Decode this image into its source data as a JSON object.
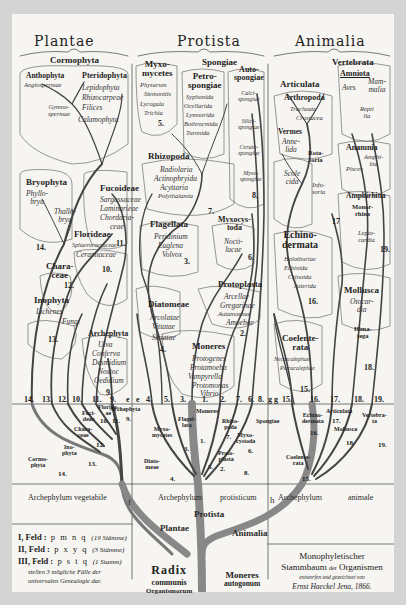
{
  "kingdoms": {
    "plantae": "Plantae",
    "protista": "Protista",
    "animalia": "Animalia"
  },
  "plantae": {
    "cormophyta": "Cormophyta",
    "anthophyta": {
      "title": "Anthophyta",
      "members": [
        "Angiospermae"
      ]
    },
    "gymnospermae": [
      "Gymno-",
      "spermae"
    ],
    "pteridophyta": {
      "title": "Pteridophyta",
      "members": [
        "Lepidophyta",
        "Rhizocarpeae",
        "Filices",
        "Calamophyta"
      ]
    },
    "bryophyta": {
      "title": "Bryophyta",
      "phyllobrya": [
        "Phyllo-",
        "brya"
      ],
      "thallobrya": [
        "Thallo-",
        "brya"
      ]
    },
    "fucoideae": {
      "title": "Fucoideae",
      "members": [
        "Sargassaceae",
        "Laminarieae",
        "Chordaria-",
        "ceae"
      ],
      "num": "11."
    },
    "florideae": {
      "title": "Florideae",
      "members": [
        "Sphaerococcaceae",
        "Ceramiaceae"
      ],
      "num": "10."
    },
    "characeae": {
      "title": [
        "Chara-",
        "ceae"
      ],
      "num": "12."
    },
    "inophyta": {
      "title": "Inophyta",
      "members": [
        "Lichenes",
        "Fungi"
      ],
      "num": "13."
    },
    "archephyta": {
      "title": "Archephyta",
      "members": [
        "Ulva",
        "Conferva",
        "Desmidium",
        "Nostoc",
        "Oedidium"
      ],
      "num": "9."
    },
    "num14": "14."
  },
  "protista": {
    "myxomycetes": {
      "title": [
        "Myxo-",
        "mycetes"
      ],
      "members": [
        "Physarum",
        "Stemonitis",
        "Lycogala",
        "Trichia"
      ],
      "num": "5."
    },
    "spongiae": "Spongiae",
    "petrospongiae": {
      "title": [
        "Petro-",
        "spongiae"
      ],
      "members": [
        "Syphonida",
        "Ocellarida",
        "Lymnorida",
        "Bothrocmida",
        "Turonida"
      ]
    },
    "autospongiae": {
      "title": [
        "Auto-",
        "spongiae"
      ],
      "members": [
        [
          "Calci-",
          "spongiae"
        ],
        [
          "Silici-",
          "spongiae"
        ],
        [
          "Cerato-",
          "spongiae"
        ],
        [
          "Myxo-",
          "spongiae"
        ]
      ],
      "num": "8."
    },
    "rhizopoda": {
      "title": "Rhizopoda",
      "members": [
        "Radiolaria",
        "Actinophryida",
        "Acyttaria",
        "Polythalamia"
      ],
      "num": "7."
    },
    "flagellata": {
      "title": "Flagellata",
      "members": [
        "Peridinium",
        "Euglena",
        "Volvox"
      ],
      "num": "3."
    },
    "myxocystoda": {
      "title": [
        "Myxocys-",
        "toda"
      ],
      "members": [
        "Nocti-",
        "lucae"
      ],
      "num": "6."
    },
    "diatomeae": {
      "title": "Diatomeae",
      "members": [
        "Arcolatae",
        "Vittatae",
        "Striatae"
      ],
      "num": "4."
    },
    "protoplasta": {
      "title": "Protoplasta",
      "members": [
        "Arcellae",
        "Gregarinae",
        "Autamoebae",
        "Amoebae"
      ],
      "num": "2."
    },
    "moneres": {
      "title": "Moneres",
      "members": [
        "Protogenes",
        "Protamoeba",
        "Vampyrella",
        "Protomonas",
        "Vibrio"
      ],
      "num": "1."
    }
  },
  "animalia": {
    "vertebrata": "Vertebrata",
    "amniota": {
      "title": "Amniota",
      "aves": "Aves",
      "mammalia": [
        "Mam-",
        "malia"
      ],
      "reptilia": [
        "Repti",
        "lia"
      ]
    },
    "articulata": "Articulata",
    "arthropoda": {
      "title": "Arthropoda",
      "members": [
        "Tracheata",
        "Crustacea"
      ]
    },
    "vermes": {
      "title": "Vermes",
      "annelida": [
        "Anne-",
        "lida"
      ],
      "rotatoria": [
        "Rota-",
        "toria"
      ],
      "scolecida": [
        "Scole",
        "cida"
      ],
      "infusoria": [
        "Infu-",
        "soria"
      ]
    },
    "anamnia": {
      "title": "Anamnia",
      "amphibia": [
        "Amphi-",
        "bia"
      ],
      "pisces": "Pisces"
    },
    "amphirhina": {
      "title": "Amphirhina",
      "monorrhina": [
        "Monor-",
        "rhina"
      ],
      "leptocardia": [
        "Lepto-",
        "cardia"
      ],
      "num": "19."
    },
    "echinodermata": {
      "title": [
        "Echino-",
        "dermata"
      ],
      "members": [
        "Holothuriae",
        "Echinida",
        "Crinoida",
        "Asterida"
      ],
      "num": "16."
    },
    "mollusca": {
      "title": "Mollusca",
      "members": [
        "Otocar-",
        "dia"
      ],
      "himatega": [
        "Hima-",
        "tega"
      ],
      "num": "18."
    },
    "coelenterata": {
      "title": [
        "Coelente-",
        "rata"
      ],
      "members": [
        "Nectacalephae",
        "Petracalephae"
      ],
      "num": "15."
    },
    "num17": "17"
  },
  "baseline_numbers": {
    "plantae": [
      "14.",
      "13.",
      "12.",
      "10.",
      "11.",
      "9.",
      "e"
    ],
    "protista": [
      "e",
      "4.",
      "5.",
      "3.",
      "1.",
      "2.",
      "7.",
      "6.",
      "8.",
      "g"
    ],
    "animalia": [
      "g",
      "15.",
      "16.",
      "17.",
      "18.",
      "19."
    ]
  },
  "lower_band": {
    "plantae": {
      "labels": [
        "Fuci-",
        "deae",
        "Floride-",
        "ae",
        "Archephyta",
        "Chara-",
        "ceae",
        "Ino-",
        "phyta",
        "Cormo-",
        "phyta"
      ],
      "nums": [
        "10.",
        "11.",
        "9.",
        "12.",
        "13.",
        "14."
      ],
      "marker": "f"
    },
    "protista": {
      "labels": [
        "Moneres",
        "Flagel-",
        "lata",
        "Myxo-",
        "mycetes",
        "Rhizo-",
        "poda",
        "Spongiae",
        "Myxo-",
        "cystoda",
        "Proto-",
        "plasta",
        "Diato-",
        "meae"
      ],
      "nums": [
        "1.",
        "3.",
        "7.",
        "6.",
        "2.",
        "8.",
        "5.",
        "4."
      ],
      "marker": "h"
    },
    "animalia": {
      "labels": [
        "Echino-",
        "dermata",
        "Articulata",
        "Mollusca",
        "Vertebra-",
        "ta",
        "Coelente-",
        "rata"
      ],
      "nums": [
        "16.",
        "17.",
        "18.",
        "19.",
        "15."
      ]
    }
  },
  "archephylum": {
    "vegetabile": "Archephylum vegetabile",
    "protisticum_a": "Archephylum",
    "protisticum_b": "protisticum",
    "animale_a": "Archephylum",
    "animale_b": "animale"
  },
  "trunk": {
    "protista": "Protista",
    "plantae": "Plantae",
    "animalia": "Animalia",
    "radix": [
      "Radix",
      "communis",
      "Organismorum"
    ],
    "moneres": [
      "Moneres",
      "autogonum"
    ]
  },
  "legend": {
    "rows": [
      {
        "field": "I, Feld :",
        "letters": "p m n q",
        "note": "(19 Stämme)"
      },
      {
        "field": "II, Feld :",
        "letters": "p x y q",
        "note": "(3 Stämme)"
      },
      {
        "field": "III, Feld :",
        "letters": "p s t q",
        "note": "(1 Stamm)"
      }
    ],
    "caption": [
      "stellen 3 mögliche Fälle der",
      "universalen Genealogie dar."
    ]
  },
  "title_block": {
    "line1": "Monophyletischer",
    "line2a": "Stammbaum",
    "line2b": "der",
    "line2c": "Organismen",
    "line3": "entworfen und gezeichnet von",
    "line4": "Ernst Haeckel Jena, 1866."
  },
  "colors": {
    "paper": "#f6f5f1",
    "ink": "#2a2a2a",
    "frame": "#d4d4d4",
    "trunk": "#8a8a86"
  }
}
